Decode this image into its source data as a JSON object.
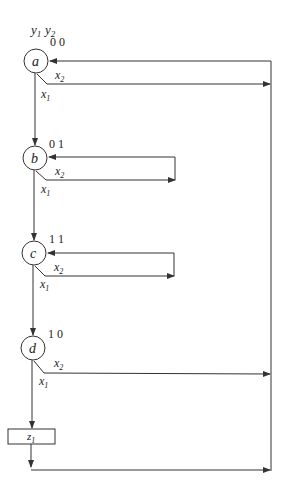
{
  "header": {
    "var1": "y",
    "var1_sub": "1",
    "var2": "y",
    "var2_sub": "2"
  },
  "states": [
    {
      "name": "a",
      "code": "0 0"
    },
    {
      "name": "b",
      "code": "0 1"
    },
    {
      "name": "c",
      "code": "1 1"
    },
    {
      "name": "d",
      "code": "1 0"
    }
  ],
  "inputs": {
    "x1": "x",
    "x1_sub": "1",
    "x2": "x",
    "x2_sub": "2"
  },
  "output_box": {
    "label": "z",
    "sub": "1"
  },
  "colors": {
    "line": "#333333",
    "background": "#ffffff"
  }
}
